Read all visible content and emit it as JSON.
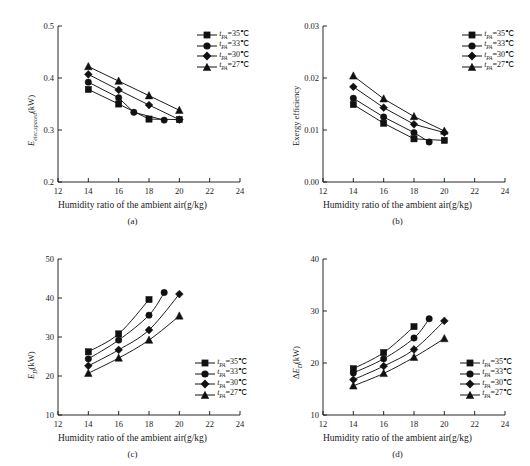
{
  "figure": {
    "xlabel": "Humidity ratio of the ambient air(g/kg)",
    "legend_series": [
      "t<sub>PA</sub>=35℃",
      "t<sub>PA</sub>=33℃",
      "t<sub>PA</sub>=30℃",
      "t<sub>PA</sub>=27℃"
    ],
    "marker_names": [
      "square-marker",
      "circle-marker",
      "diamond-marker",
      "triangle-marker"
    ],
    "line_color": "#111111"
  },
  "panels": [
    {
      "id": "a",
      "caption": "(a)",
      "ylabel_html": "<i>E</i><sub>elec,spaced</sub>(kW)"
    },
    {
      "id": "b",
      "caption": "(b)",
      "ylabel_html": "Exergy efficiency"
    },
    {
      "id": "c",
      "caption": "(c)",
      "ylabel_html": "<i>E</i><sub>D</sub>(kW)"
    },
    {
      "id": "d",
      "caption": "(d)",
      "ylabel_html": "Δ<i>E</i><sub>D</sub>(kW)"
    }
  ],
  "chart_data": [
    {
      "panel": "a",
      "type": "line",
      "title": "(a)",
      "xlabel": "Humidity ratio of the ambient air(g/kg)",
      "ylabel": "E_elec,spaced(kW)",
      "xlim": [
        12,
        24
      ],
      "ylim": [
        0.2,
        0.5
      ],
      "xticks": [
        12,
        14,
        16,
        18,
        20,
        22,
        24
      ],
      "yticks": [
        0.2,
        0.3,
        0.4,
        0.5
      ],
      "grid": false,
      "legend_position": "top-right",
      "series": [
        {
          "name": "t_PA=35℃",
          "marker": "square",
          "x": [
            14,
            16,
            18,
            20
          ],
          "values": [
            0.378,
            0.35,
            0.321,
            0.32
          ]
        },
        {
          "name": "t_PA=33℃",
          "marker": "circle",
          "x": [
            14,
            16,
            17,
            19
          ],
          "values": [
            0.392,
            0.362,
            0.334,
            0.319
          ]
        },
        {
          "name": "t_PA=30℃",
          "marker": "diamond",
          "x": [
            14,
            16,
            18,
            20
          ],
          "values": [
            0.407,
            0.377,
            0.348,
            0.32
          ]
        },
        {
          "name": "t_PA=27℃",
          "marker": "triangle",
          "x": [
            14,
            16,
            18,
            20
          ],
          "values": [
            0.422,
            0.394,
            0.366,
            0.338
          ]
        }
      ]
    },
    {
      "panel": "b",
      "type": "line",
      "title": "(b)",
      "xlabel": "Humidity ratio of the ambient air(g/kg)",
      "ylabel": "Exergy efficiency",
      "xlim": [
        12,
        24
      ],
      "ylim": [
        0,
        0.03
      ],
      "xticks": [
        12,
        14,
        16,
        18,
        20,
        22,
        24
      ],
      "yticks": [
        0,
        0.01,
        0.02,
        0.03
      ],
      "grid": false,
      "legend_position": "top-right",
      "series": [
        {
          "name": "t_PA=35℃",
          "marker": "square",
          "x": [
            14,
            16,
            18,
            20
          ],
          "values": [
            0.0149,
            0.0113,
            0.0083,
            0.008
          ]
        },
        {
          "name": "t_PA=33℃",
          "marker": "circle",
          "x": [
            14,
            16,
            18,
            19
          ],
          "values": [
            0.0161,
            0.0125,
            0.0095,
            0.0077
          ]
        },
        {
          "name": "t_PA=30℃",
          "marker": "diamond",
          "x": [
            14,
            16,
            18,
            20
          ],
          "values": [
            0.0183,
            0.0143,
            0.0111,
            0.0095
          ]
        },
        {
          "name": "t_PA=27℃",
          "marker": "triangle",
          "x": [
            14,
            16,
            18,
            20
          ],
          "values": [
            0.0204,
            0.016,
            0.0126,
            0.0098
          ]
        }
      ]
    },
    {
      "panel": "c",
      "type": "line",
      "title": "(c)",
      "xlabel": "Humidity ratio of the ambient air(g/kg)",
      "ylabel": "E_D(kW)",
      "xlim": [
        12,
        24
      ],
      "ylim": [
        10,
        50
      ],
      "xticks": [
        12,
        14,
        16,
        18,
        20,
        22,
        24
      ],
      "yticks": [
        10,
        20,
        30,
        40,
        50
      ],
      "grid": false,
      "legend_position": "bottom-right",
      "series": [
        {
          "name": "t_PA=35℃",
          "marker": "square",
          "x": [
            14,
            16,
            18
          ],
          "values": [
            26.2,
            30.8,
            39.6
          ]
        },
        {
          "name": "t_PA=33℃",
          "marker": "circle",
          "x": [
            14,
            16,
            18,
            19
          ],
          "values": [
            24.4,
            29.2,
            35.6,
            41.4
          ]
        },
        {
          "name": "t_PA=30℃",
          "marker": "diamond",
          "x": [
            14,
            16,
            18,
            20
          ],
          "values": [
            22.6,
            26.7,
            31.8,
            41.0
          ]
        },
        {
          "name": "t_PA=27℃",
          "marker": "triangle",
          "x": [
            14,
            16,
            18,
            20
          ],
          "values": [
            20.7,
            24.6,
            29.2,
            35.4
          ]
        }
      ]
    },
    {
      "panel": "d",
      "type": "line",
      "title": "(d)",
      "xlabel": "Humidity ratio of the ambient air(g/kg)",
      "ylabel": "ΔE_D(kW)",
      "xlim": [
        12,
        24
      ],
      "ylim": [
        10,
        40
      ],
      "xticks": [
        12,
        14,
        16,
        18,
        20,
        22,
        24
      ],
      "yticks": [
        10,
        20,
        30,
        40
      ],
      "grid": false,
      "legend_position": "bottom-right",
      "series": [
        {
          "name": "t_PA=35℃",
          "marker": "square",
          "x": [
            14,
            16,
            18
          ],
          "values": [
            18.9,
            22.0,
            27.0
          ]
        },
        {
          "name": "t_PA=33℃",
          "marker": "circle",
          "x": [
            14,
            16,
            18,
            19
          ],
          "values": [
            18.1,
            20.8,
            24.8,
            28.5
          ]
        },
        {
          "name": "t_PA=30℃",
          "marker": "diamond",
          "x": [
            14,
            16,
            18,
            20
          ],
          "values": [
            16.8,
            19.4,
            22.6,
            28.1
          ]
        },
        {
          "name": "t_PA=27℃",
          "marker": "triangle",
          "x": [
            14,
            16,
            18,
            20
          ],
          "values": [
            15.6,
            18.0,
            21.1,
            24.7
          ]
        }
      ]
    }
  ]
}
